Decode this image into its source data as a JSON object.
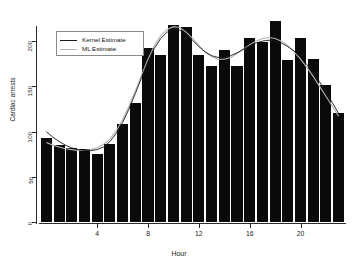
{
  "chart_data": {
    "type": "bar",
    "title": "",
    "subtitle": "",
    "xlabel": "Hour",
    "ylabel": "Cardiac arrests",
    "categories": [
      0,
      1,
      2,
      3,
      4,
      5,
      6,
      7,
      8,
      9,
      10,
      11,
      12,
      13,
      14,
      15,
      16,
      17,
      18,
      19,
      20,
      21,
      22,
      23
    ],
    "values": [
      93,
      85,
      82,
      81,
      75,
      86,
      108,
      132,
      192,
      185,
      218,
      216,
      185,
      172,
      190,
      173,
      204,
      199,
      222,
      179,
      204,
      180,
      152,
      120
    ],
    "xlim": [
      0,
      24
    ],
    "ylim": [
      0,
      230
    ],
    "xticks": [
      4,
      8,
      12,
      16,
      20
    ],
    "yticks": [
      0,
      50,
      100,
      150,
      200
    ],
    "grid": false,
    "legend_position": "top-left",
    "series": [
      {
        "name": "Kernel Estimate",
        "type": "line",
        "color": "#1a1a1a",
        "x": [
          0.0,
          0.5,
          1.0,
          1.5,
          2.0,
          2.5,
          3.0,
          3.5,
          4.0,
          4.5,
          5.0,
          5.5,
          6.0,
          6.5,
          7.0,
          7.5,
          8.0,
          8.5,
          9.0,
          9.5,
          10.0,
          10.5,
          11.0,
          11.5,
          12.0,
          12.5,
          13.0,
          13.5,
          14.0,
          14.5,
          15.0,
          15.5,
          16.0,
          16.5,
          17.0,
          17.5,
          18.0,
          18.5,
          19.0,
          19.5,
          20.0,
          20.5,
          21.0,
          21.5,
          22.0,
          22.5,
          23.0
        ],
        "y": [
          100,
          94,
          89,
          85,
          82,
          80,
          79,
          79,
          80,
          83,
          89,
          98,
          110,
          125,
          142,
          160,
          177,
          192,
          203,
          210,
          213,
          212,
          208,
          201,
          194,
          188,
          184,
          182,
          182,
          184,
          187,
          191,
          195,
          198,
          200,
          201,
          200,
          198,
          194,
          189,
          182,
          174,
          165,
          155,
          144,
          132,
          120
        ]
      },
      {
        "name": "ML Estimate",
        "type": "line",
        "color": "#b4b4b4",
        "x": [
          0.0,
          0.5,
          1.0,
          1.5,
          2.0,
          2.5,
          3.0,
          3.5,
          4.0,
          4.5,
          5.0,
          5.5,
          6.0,
          6.5,
          7.0,
          7.5,
          8.0,
          8.5,
          9.0,
          9.5,
          10.0,
          10.5,
          11.0,
          11.5,
          12.0,
          12.5,
          13.0,
          13.5,
          14.0,
          14.5,
          15.0,
          15.5,
          16.0,
          16.5,
          17.0,
          17.5,
          18.0,
          18.5,
          19.0,
          19.5,
          20.0,
          20.5,
          21.0,
          21.5,
          22.0,
          22.5,
          23.0
        ],
        "y": [
          88,
          85,
          83,
          81,
          80,
          79,
          79,
          80,
          82,
          86,
          92,
          101,
          113,
          128,
          145,
          163,
          180,
          195,
          206,
          213,
          216,
          215,
          210,
          203,
          195,
          188,
          183,
          180,
          180,
          182,
          186,
          191,
          196,
          200,
          203,
          204,
          203,
          200,
          195,
          188,
          180,
          171,
          161,
          150,
          139,
          128,
          117
        ]
      }
    ]
  },
  "legend": {
    "items": [
      {
        "label": "Kernel Estimate",
        "color": "#1a1a1a"
      },
      {
        "label": "ML Estimate",
        "color": "#b4b4b4"
      }
    ]
  },
  "axes": {
    "y_tick_labels": [
      "0",
      "50",
      "100",
      "150",
      "200"
    ],
    "x_tick_labels": [
      "4",
      "8",
      "12",
      "16",
      "20"
    ],
    "y_title": "Cardiac arrests",
    "x_title": "Hour"
  }
}
